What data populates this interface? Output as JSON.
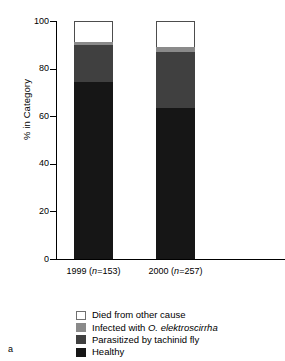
{
  "panel": {
    "label": "a"
  },
  "chart_data": {
    "type": "bar",
    "subtype": "stacked-bar-100",
    "title": "",
    "xlabel": "",
    "ylabel": "% in Category",
    "ylim": [
      0,
      100
    ],
    "yticks": [
      0,
      20,
      40,
      60,
      80,
      100
    ],
    "ytick_labels": [
      "0",
      "20",
      "40",
      "60",
      "80",
      "100"
    ],
    "grid": false,
    "legend_position": "below-plot",
    "categories": [
      "1999 (n=153)",
      "2000 (n=257)"
    ],
    "category_labels": [
      {
        "year": "1999",
        "n_prefix": "(",
        "n_italic": "n",
        "n_rest": "=153)"
      },
      {
        "year": "2000",
        "n_prefix": "(",
        "n_italic": "n",
        "n_rest": "=257)"
      }
    ],
    "series": [
      {
        "name": "Healthy",
        "color": "#161616",
        "values": [
          74.5,
          63.5
        ]
      },
      {
        "name": "Parasitized by tachinid fly",
        "color": "#404040",
        "values": [
          15.5,
          23.5
        ]
      },
      {
        "name": "Infected with O. elektroscirrha",
        "color": "#8a8a8a",
        "values": [
          1.0,
          2.0
        ]
      },
      {
        "name": "Died from other cause",
        "color": "#ffffff",
        "values": [
          9.0,
          11.0
        ]
      }
    ],
    "stack_order_top_to_bottom": [
      "Died from other cause",
      "Infected with O. elektroscirrha",
      "Parasitized by tachinid fly",
      "Healthy"
    ]
  },
  "legend": {
    "items": [
      {
        "swatch": "white",
        "text_before": "Died from other cause",
        "italic": "",
        "text_after": ""
      },
      {
        "swatch": "midgray",
        "text_before": "Infected with ",
        "italic": "O. elektroscirrha",
        "text_after": ""
      },
      {
        "swatch": "darkgray",
        "text_before": "Parasitized by tachinid fly",
        "italic": "",
        "text_after": ""
      },
      {
        "swatch": "black",
        "text_before": "Healthy",
        "italic": "",
        "text_after": ""
      }
    ]
  }
}
